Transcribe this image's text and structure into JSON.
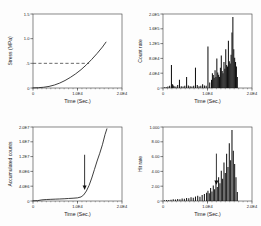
{
  "figure": {
    "panel_count": 4,
    "background": "#fdfdfd",
    "line_color": "#202020"
  },
  "chart_data": [
    {
      "id": "panel-top-left",
      "type": "line",
      "title": "",
      "xlabel": "Time (Sec.)",
      "ylabel": "Stress (MPa)",
      "xlim": [
        0,
        20000
      ],
      "ylim": [
        0,
        1.5
      ],
      "grid": false,
      "legend": "none",
      "xticks": [
        0,
        10000,
        20000
      ],
      "xticklabels": [
        "0",
        "1.0E4",
        "2.0E4"
      ],
      "yticks": [
        0,
        0.5,
        1.0,
        1.5
      ],
      "yticklabels": [
        "0",
        ".5",
        "1.0",
        "1.5"
      ],
      "series": [
        {
          "name": "stress",
          "style": "solid",
          "x": [
            0,
            1200,
            2400,
            3600,
            4800,
            6000,
            7200,
            8400,
            9600,
            10800,
            12000,
            13200,
            14400,
            15600,
            16400
          ],
          "y": [
            0.002,
            0.006,
            0.015,
            0.032,
            0.06,
            0.1,
            0.152,
            0.215,
            0.288,
            0.372,
            0.47,
            0.58,
            0.7,
            0.83,
            0.93
          ]
        }
      ],
      "annotations": [
        {
          "kind": "hline-dashed",
          "y": 0.5,
          "x_start": 0,
          "x_end": 12600,
          "label": ""
        }
      ]
    },
    {
      "id": "panel-top-right",
      "type": "bar",
      "title": "",
      "xlabel": "Time (Sec.)",
      "ylabel": "Count rate",
      "xlim": [
        0,
        20000
      ],
      "ylim": [
        0,
        2.0
      ],
      "grid": false,
      "legend": "none",
      "xticks": [
        0,
        10000,
        20000
      ],
      "xticklabels": [
        "0",
        "1.0E4",
        "2.0E4"
      ],
      "yticks": [
        0,
        0.4,
        0.8,
        1.2,
        1.6,
        2.0
      ],
      "yticklabels": [
        "0",
        "4.0E4",
        "8.0E4",
        "1.2E5",
        "1.6E5",
        "2.0E5"
      ],
      "series": [
        {
          "name": "count-rate",
          "x": [
            300,
            700,
            1100,
            1500,
            1900,
            2150,
            2300,
            2500,
            2900,
            3300,
            3700,
            4100,
            4500,
            4900,
            5300,
            5700,
            6100,
            6500,
            6900,
            7300,
            7700,
            8100,
            8500,
            8900,
            9300,
            9700,
            10100,
            10500,
            10900,
            11100,
            11300,
            11500,
            11700,
            11900,
            12100,
            12300,
            12500,
            12700,
            12900,
            13100,
            13300,
            13500,
            13700,
            13900,
            14100,
            14300,
            14500,
            14700,
            14900,
            15100,
            15300,
            15500,
            15700,
            15900,
            16100,
            16300,
            16500,
            16700
          ],
          "y": [
            0.02,
            0.03,
            0.04,
            0.06,
            0.62,
            0.1,
            0.07,
            0.05,
            0.04,
            0.08,
            0.22,
            0.05,
            0.04,
            0.06,
            0.3,
            0.07,
            0.05,
            0.04,
            0.06,
            0.55,
            0.08,
            0.05,
            0.06,
            0.1,
            0.07,
            0.06,
            1.12,
            0.15,
            0.22,
            0.4,
            0.35,
            0.28,
            0.48,
            0.3,
            0.8,
            0.42,
            0.36,
            0.3,
            0.55,
            0.88,
            0.46,
            0.4,
            0.7,
            0.52,
            1.05,
            0.62,
            0.58,
            1.28,
            0.72,
            0.66,
            0.9,
            1.5,
            1.92,
            1.05,
            0.82,
            0.7,
            0.58,
            0.3
          ]
        }
      ],
      "annotations": []
    },
    {
      "id": "panel-bottom-left",
      "type": "line",
      "title": "",
      "xlabel": "Time (Sec.)",
      "ylabel": "Accumulated counts",
      "xlim": [
        0,
        20000
      ],
      "ylim": [
        0,
        2.0
      ],
      "grid": false,
      "legend": "none",
      "xticks": [
        0,
        10000,
        20000
      ],
      "xticklabels": [
        "0",
        "1.0E4",
        "2.0E4"
      ],
      "yticks": [
        0,
        0.4,
        0.8,
        1.2,
        1.6,
        2.0
      ],
      "yticklabels": [
        "0",
        "4.0E6",
        "8.0E6",
        "1.2E7",
        "1.6E7",
        "2.0E7"
      ],
      "series": [
        {
          "name": "accumulated-counts",
          "style": "solid",
          "x": [
            0,
            1000,
            2000,
            3000,
            4000,
            5000,
            6000,
            7000,
            8000,
            9000,
            10000,
            10800,
            11400,
            12000,
            12600,
            13200,
            13800,
            14400,
            15000,
            15600,
            16200,
            16600
          ],
          "y": [
            0.005,
            0.01,
            0.03,
            0.04,
            0.045,
            0.05,
            0.055,
            0.06,
            0.068,
            0.075,
            0.085,
            0.11,
            0.165,
            0.27,
            0.42,
            0.62,
            0.85,
            1.08,
            1.29,
            1.52,
            1.8,
            1.95
          ]
        }
      ],
      "annotations": [
        {
          "kind": "arrow-down",
          "x": 11600,
          "y_tail": 1.25,
          "y_head": 0.33,
          "label": ""
        }
      ]
    },
    {
      "id": "panel-bottom-right",
      "type": "bar",
      "title": "",
      "xlabel": "Time (Sec.)",
      "ylabel": "Hit rate",
      "xlim": [
        0,
        20000
      ],
      "ylim": [
        0,
        10.0
      ],
      "grid": false,
      "legend": "none",
      "xticks": [
        0,
        10000,
        20000
      ],
      "xticklabels": [
        "0",
        "1.0E4",
        "2.0E4"
      ],
      "yticks": [
        0,
        2.0,
        4.0,
        6.0,
        8.0,
        10.0
      ],
      "yticklabels": [
        "0",
        "2.00",
        "4.00",
        "6.00",
        "8.00",
        "1.000"
      ],
      "series": [
        {
          "name": "hit-rate",
          "x": [
            300,
            800,
            1300,
            1800,
            2300,
            2800,
            3300,
            3800,
            4300,
            4800,
            5300,
            5800,
            6300,
            6800,
            7300,
            7800,
            8300,
            8800,
            9300,
            9800,
            10100,
            10400,
            10700,
            11000,
            11300,
            11600,
            11900,
            12200,
            12500,
            12800,
            13100,
            13400,
            13700,
            14000,
            14300,
            14600,
            14900,
            15200,
            15500,
            15800,
            16100,
            16400,
            16700
          ],
          "y": [
            0.1,
            0.15,
            0.12,
            0.18,
            0.22,
            0.2,
            0.28,
            0.25,
            0.35,
            0.3,
            0.42,
            0.38,
            0.5,
            0.45,
            0.6,
            0.7,
            0.58,
            0.82,
            0.95,
            1.1,
            1.4,
            1.05,
            1.75,
            1.3,
            2.1,
            1.6,
            2.6,
            1.9,
            3.2,
            2.4,
            4.1,
            3.0,
            5.2,
            3.8,
            6.4,
            4.6,
            7.8,
            5.5,
            9.6,
            6.8,
            5.0,
            3.2,
            1.2
          ]
        }
      ],
      "annotations": [
        {
          "kind": "arrow-down",
          "x": 12000,
          "y_tail": 6.4,
          "y_head": 2.35,
          "label": ""
        }
      ]
    }
  ]
}
